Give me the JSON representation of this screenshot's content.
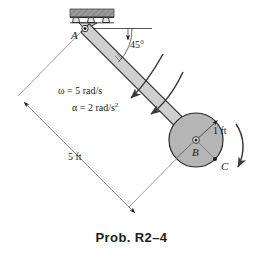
{
  "figure": {
    "name": "rod-and-disk-kinematics-diagram",
    "caption": "Prob. R2–4",
    "background_color": "#ffffff",
    "stroke_color": "#1a1a1a",
    "rod_fill_color": "#cfcfcf",
    "disk_fill_color": "#b5b5b5",
    "support_fill_color": "#9a9a9a"
  },
  "labels": {
    "point_a": "A",
    "point_b": "B",
    "point_c": "C",
    "angle": "45°",
    "omega": "ω = 5 rad/s",
    "alpha_main": "α = 2 rad/s",
    "alpha_exponent": "2",
    "disk_radius": "1 ft",
    "rod_length": "5 ft"
  },
  "geometry": {
    "pin_a": {
      "x": 85,
      "y": 28
    },
    "disk_center_b": {
      "x": 196,
      "y": 140
    },
    "disk_radius_px": 27,
    "point_c": {
      "x": 215,
      "y": 159
    },
    "rod_angle_deg": 45,
    "rod_half_width_px": 6
  },
  "values": {
    "angular_velocity": 5,
    "angular_velocity_units": "rad/s",
    "angular_acceleration": 2,
    "angular_acceleration_units": "rad/s^2",
    "disk_radius": 1,
    "disk_radius_units": "ft",
    "rod_length": 5,
    "rod_length_units": "ft",
    "inclination_angle": 45,
    "inclination_units": "deg"
  }
}
